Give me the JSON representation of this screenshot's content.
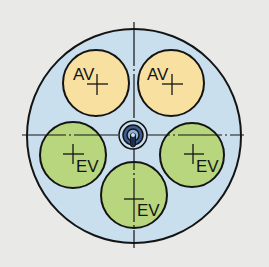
{
  "diagram": {
    "colors": {
      "background": "#e9e9e7",
      "housing_fill": "#c9dfee",
      "stroke": "#141414",
      "av_fill": "#f8e0a0",
      "ev_fill": "#b8d67e",
      "hub_fill": "#3c5f93",
      "hub_inner": "#8fb0d8"
    },
    "ports": [
      {
        "id": "av-left",
        "label": "AV",
        "type": "outlet"
      },
      {
        "id": "av-right",
        "label": "AV",
        "type": "outlet"
      },
      {
        "id": "ev-left",
        "label": "EV",
        "type": "inlet"
      },
      {
        "id": "ev-right",
        "label": "EV",
        "type": "inlet"
      },
      {
        "id": "ev-bottom",
        "label": "EV",
        "type": "inlet"
      }
    ]
  }
}
